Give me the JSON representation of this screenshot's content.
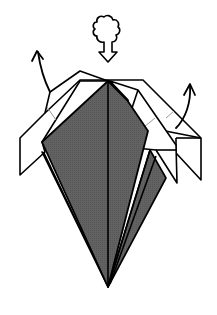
{
  "diagram": {
    "type": "origami-fold-step",
    "description": "Origami base with dark colored side facing, white flaps folded outward at top left and right",
    "symbols": [
      {
        "name": "push-in-symbol",
        "meaning": "push / sink at top point",
        "glyph": "tree-shaped push arrow"
      },
      {
        "name": "unfold-arrow-left",
        "meaning": "pull flap out to the left"
      },
      {
        "name": "unfold-arrow-right",
        "meaning": "pull flap out to the right"
      }
    ],
    "colors": {
      "paper_colored": "#5f5f5f",
      "paper_white": "#ffffff",
      "line": "#000000",
      "crease": "#a0a0a0",
      "background": "#ffffff"
    }
  }
}
